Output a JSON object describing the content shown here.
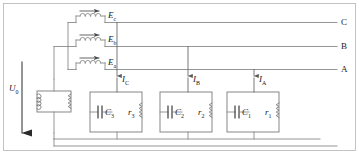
{
  "diagram": {
    "colors": {
      "wire": "#8a8a8a",
      "wire_dark": "#5a5a5a",
      "text": "#1a1a1a",
      "background": "#ffffff"
    },
    "supply": {
      "voltage_label": "U",
      "voltage_sub": "0",
      "arrow_direction": "down"
    },
    "transformer": {
      "name": "transformer",
      "primary": "coil",
      "secondary": "resistor"
    },
    "sources": [
      {
        "label": "E",
        "sub": "c",
        "line": "C",
        "arrow": "right"
      },
      {
        "label": "E",
        "sub": "b",
        "line": "B",
        "arrow": "right"
      },
      {
        "label": "E",
        "sub": "a",
        "line": "A",
        "arrow": "right"
      }
    ],
    "bus_lines": [
      {
        "name": "C",
        "label": "C"
      },
      {
        "name": "B",
        "label": "B"
      },
      {
        "name": "A",
        "label": "A"
      }
    ],
    "currents": [
      {
        "label": "I",
        "sub": "C",
        "arrow": "down"
      },
      {
        "label": "I",
        "sub": "B",
        "arrow": "down"
      },
      {
        "label": "I",
        "sub": "A",
        "arrow": "down"
      }
    ],
    "loads": [
      {
        "capacitor": "C",
        "capacitor_sub": "3",
        "resistor": "r",
        "resistor_sub": "3"
      },
      {
        "capacitor": "C",
        "capacitor_sub": "2",
        "resistor": "r",
        "resistor_sub": "2"
      },
      {
        "capacitor": "C",
        "capacitor_sub": "1",
        "resistor": "r",
        "resistor_sub": "1"
      }
    ]
  }
}
